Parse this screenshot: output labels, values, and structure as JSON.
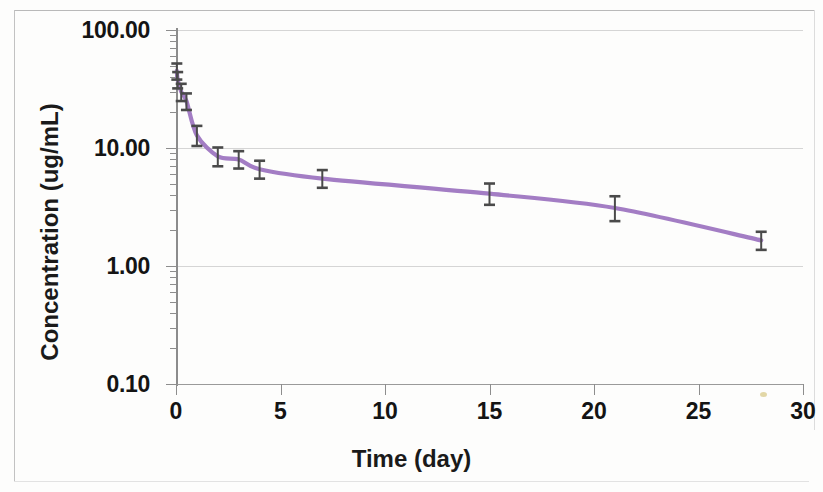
{
  "chart_data": {
    "type": "line",
    "title": "",
    "xlabel": "Time (day)",
    "ylabel": "Concentration (ug/mL)",
    "yscale": "log",
    "xlim": [
      0,
      30
    ],
    "ylim": [
      0.1,
      100.0
    ],
    "grid": true,
    "legend": "none",
    "line_color": "#a37dc4",
    "errorbar_color": "#4a4a4a",
    "x_ticks": [
      0,
      5,
      10,
      15,
      20,
      25,
      30
    ],
    "x_tick_labels": [
      "0",
      "5",
      "10",
      "15",
      "20",
      "25",
      "30"
    ],
    "y_ticks": [
      0.1,
      1.0,
      10.0,
      100.0
    ],
    "y_tick_labels": [
      "0.10",
      "1.00",
      "10.00",
      "100.00"
    ],
    "series": [
      {
        "name": "Concentration",
        "x": [
          0.04,
          0.08,
          0.25,
          0.5,
          1.0,
          2.0,
          3.0,
          4.0,
          7.0,
          15.0,
          21.0,
          28.0
        ],
        "values": [
          45.0,
          38.0,
          30.0,
          25.0,
          12.8,
          8.5,
          8.0,
          6.6,
          5.5,
          4.1,
          3.1,
          1.65
        ],
        "err_low": [
          7.0,
          6.0,
          5.0,
          4.0,
          2.4,
          1.5,
          1.3,
          1.1,
          0.9,
          0.8,
          0.7,
          0.28
        ],
        "err_high": [
          7.0,
          6.0,
          5.0,
          4.0,
          2.6,
          1.6,
          1.4,
          1.2,
          1.0,
          0.9,
          0.8,
          0.3
        ]
      }
    ]
  },
  "axis": {
    "x_title": "Time (day)",
    "y_title": "Concentration (ug/mL)",
    "y_labels": [
      "100.00",
      "10.00",
      "1.00",
      "0.10"
    ],
    "x_labels": [
      "0",
      "5",
      "10",
      "15",
      "20",
      "25",
      "30"
    ]
  }
}
